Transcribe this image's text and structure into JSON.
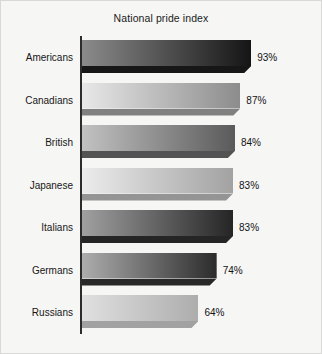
{
  "chart_data": {
    "type": "bar",
    "orientation": "horizontal",
    "title": "National pride index",
    "xlabel": "",
    "ylabel": "",
    "xlim": [
      0,
      100
    ],
    "grid": false,
    "legend": null,
    "value_suffix": "%",
    "categories": [
      "Americans",
      "Canadians",
      "British",
      "Japanese",
      "Italians",
      "Germans",
      "Russians"
    ],
    "values": [
      93,
      87,
      84,
      83,
      83,
      74,
      64
    ],
    "value_labels": [
      "93%",
      "87%",
      "84%",
      "83%",
      "83%",
      "74%",
      "64%"
    ],
    "bars": [
      {
        "category": "Americans",
        "value": 93,
        "label": "93%",
        "shade_start": "#8b8b8b",
        "shade_end": "#151515",
        "shadow": "#0b0b0b"
      },
      {
        "category": "Canadians",
        "value": 87,
        "label": "87%",
        "shade_start": "#e8e8e8",
        "shade_end": "#8c8c8c",
        "shadow": "#7a7a7a"
      },
      {
        "category": "British",
        "value": 84,
        "label": "84%",
        "shade_start": "#c2c2c2",
        "shade_end": "#5a5a5a",
        "shadow": "#4a4a4a"
      },
      {
        "category": "Japanese",
        "value": 83,
        "label": "83%",
        "shade_start": "#ececec",
        "shade_end": "#a2a2a2",
        "shadow": "#8f8f8f"
      },
      {
        "category": "Italians",
        "value": 83,
        "label": "83%",
        "shade_start": "#a0a0a0",
        "shade_end": "#252525",
        "shadow": "#1a1a1a"
      },
      {
        "category": "Germans",
        "value": 74,
        "label": "74%",
        "shade_start": "#adadad",
        "shade_end": "#2b2b2b",
        "shadow": "#1d1d1d"
      },
      {
        "category": "Russians",
        "value": 64,
        "label": "64%",
        "shade_start": "#e0e0e0",
        "shade_end": "#adadad",
        "shadow": "#9d9d9d"
      }
    ],
    "colors": {
      "background": "#f6f6f5",
      "axis": "#2c2c2c",
      "text": "#161616",
      "border": "#d8d8d6"
    }
  }
}
